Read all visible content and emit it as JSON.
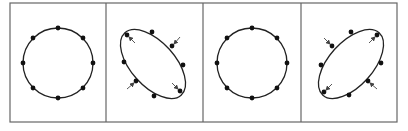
{
  "figure": {
    "frame": {
      "x": 10,
      "y": 3,
      "width": 387,
      "height": 119,
      "stroke": "#666666"
    },
    "dividers": [
      106,
      203,
      301
    ],
    "colors": {
      "line": "#222222",
      "dot": "#111111",
      "frame": "#666666",
      "arrow": "#444444"
    },
    "panels": [
      {
        "id": "panel-1",
        "shape": "circle",
        "cx": 58,
        "cy": 63,
        "rx": 35,
        "ry": 35,
        "rotation": 0,
        "dots": [
          [
            58,
            28
          ],
          [
            83,
            38
          ],
          [
            93,
            63
          ],
          [
            83,
            88
          ],
          [
            58,
            98
          ],
          [
            33,
            88
          ],
          [
            23,
            63
          ],
          [
            33,
            38
          ]
        ],
        "arrows": []
      },
      {
        "id": "panel-2",
        "shape": "ellipse",
        "cx": 153,
        "cy": 64,
        "rx": 42,
        "ry": 22,
        "rotation": 48,
        "dots": [
          [
            127,
            35
          ],
          [
            152,
            32
          ],
          [
            172,
            46
          ],
          [
            183,
            65
          ],
          [
            180,
            91
          ],
          [
            154,
            96
          ],
          [
            136,
            81
          ],
          [
            124,
            62
          ]
        ],
        "arrows": [
          {
            "from": [
              135,
              43
            ],
            "to": [
              129,
              37
            ]
          },
          {
            "from": [
              180,
              37
            ],
            "to": [
              174,
              44
            ]
          },
          {
            "from": [
              127,
              89
            ],
            "to": [
              134,
              83
            ]
          },
          {
            "from": [
              172,
              83
            ],
            "to": [
              178,
              89
            ]
          }
        ]
      },
      {
        "id": "panel-3",
        "shape": "circle",
        "cx": 252,
        "cy": 63,
        "rx": 35,
        "ry": 35,
        "rotation": 0,
        "dots": [
          [
            252,
            28
          ],
          [
            277,
            38
          ],
          [
            287,
            63
          ],
          [
            277,
            88
          ],
          [
            252,
            98
          ],
          [
            227,
            88
          ],
          [
            217,
            63
          ],
          [
            227,
            38
          ]
        ],
        "arrows": []
      },
      {
        "id": "panel-4",
        "shape": "ellipse",
        "cx": 351,
        "cy": 64,
        "rx": 42,
        "ry": 22,
        "rotation": -48,
        "dots": [
          [
            332,
            46
          ],
          [
            351,
            32
          ],
          [
            377,
            35
          ],
          [
            381,
            63
          ],
          [
            368,
            81
          ],
          [
            349,
            95
          ],
          [
            324,
            92
          ],
          [
            321,
            65
          ]
        ],
        "arrows": [
          {
            "from": [
              324,
              38
            ],
            "to": [
              330,
              44
            ]
          },
          {
            "from": [
              369,
              43
            ],
            "to": [
              375,
              37
            ]
          },
          {
            "from": [
              332,
              84
            ],
            "to": [
              326,
              90
            ]
          },
          {
            "from": [
              377,
              89
            ],
            "to": [
              370,
              83
            ]
          }
        ]
      }
    ]
  }
}
